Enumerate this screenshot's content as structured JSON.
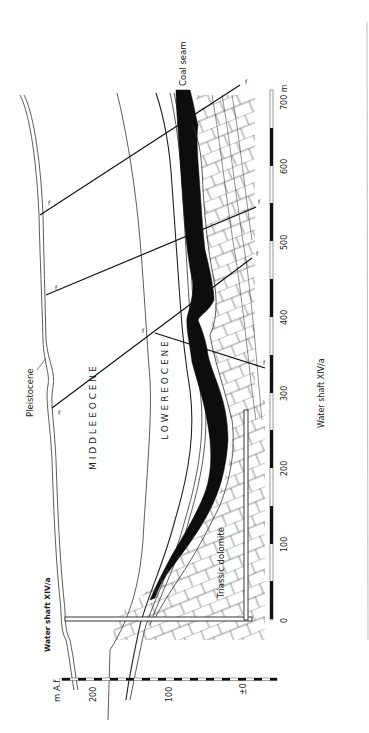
{
  "figure": {
    "type": "geological-cross-section",
    "orientation": "rotated-90-ccw",
    "units": {
      "distance": "m",
      "elevation": "m A.f."
    },
    "labels": {
      "coal_seam": "Coal seam",
      "pleistocene": "Pleistocene",
      "middle_eocene": "M I D D L E   E O C E N E",
      "lower_eocene": "L O W E R   E O C E N E",
      "triassic_dolomite": "Triassic dolomite",
      "water_shaft_top": "Water shaft XIV/a",
      "water_shaft_bottom": "Water shaft  XIV/a",
      "fault_marker": "f"
    },
    "distance_scale": {
      "unit_label": "700 m",
      "ticks": [
        "0",
        "100",
        "200",
        "300",
        "400",
        "500",
        "600",
        "700 m"
      ]
    },
    "elevation_scale": {
      "unit_label": "m A.f.",
      "ticks": [
        "200",
        "100",
        "±0"
      ]
    },
    "colors": {
      "ink": "#1a1a1a",
      "coal": "#0d0d0d",
      "paper": "#ffffff",
      "rule": "#999999"
    }
  }
}
